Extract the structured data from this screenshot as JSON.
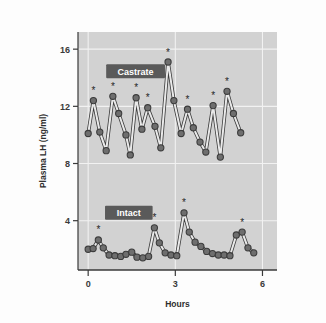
{
  "figure": {
    "background_color": "#fdfdfd",
    "plot_background_color": "#d2d2d2",
    "grid_color": "#f2f2f2",
    "axis_color": "#3a3a3a",
    "marker_color": "#6e6e6e",
    "marker_edge_color": "#3c3c3c",
    "line_color": "#e9e9e9",
    "label_box_color": "#5a5a5a"
  },
  "chart_data": {
    "type": "line",
    "title": "",
    "xlabel": "Hours",
    "ylabel": "Plasma LH (ng/ml)",
    "xlim": [
      -0.35,
      6.5
    ],
    "ylim": [
      0.55,
      17.2
    ],
    "xticks": [
      0,
      3,
      6
    ],
    "xtick_labels": [
      "0",
      "3",
      "6"
    ],
    "yticks": [
      4,
      8,
      12,
      16
    ],
    "ytick_labels": [
      "4",
      "8",
      "12",
      "16"
    ],
    "grid": true,
    "legend_position": "inline-annotation",
    "series": [
      {
        "name": "Castrate",
        "label_x": 0.62,
        "label_y": 14.45,
        "x": [
          0.0,
          0.2,
          0.4,
          0.6,
          0.8,
          1.0,
          1.2,
          1.4,
          1.6,
          1.8,
          2.0,
          2.2,
          2.4,
          2.6,
          2.8,
          3.0,
          3.2,
          3.4,
          3.6,
          3.8,
          4.0,
          4.2,
          4.4,
          4.6,
          4.8,
          5.0,
          5.2,
          5.4,
          5.6,
          5.8,
          6.0,
          6.2
        ],
        "values": [
          10.1,
          12.4,
          10.2,
          8.9,
          12.7,
          11.5,
          10.0,
          8.6,
          12.6,
          10.4,
          11.9,
          10.6,
          9.1,
          15.1,
          12.4,
          10.1,
          11.8,
          10.5,
          9.5,
          8.8,
          12.05,
          8.45,
          13.05,
          11.5,
          10.15,
          10.15,
          10.15,
          10.15,
          10.15,
          10.15,
          10.15,
          10.15
        ],
        "points": [
          {
            "x": 0.0,
            "y": 10.1,
            "star": false
          },
          {
            "x": 0.18,
            "y": 12.4,
            "star": true
          },
          {
            "x": 0.4,
            "y": 10.2,
            "star": false
          },
          {
            "x": 0.62,
            "y": 8.9,
            "star": false
          },
          {
            "x": 0.85,
            "y": 12.7,
            "star": true
          },
          {
            "x": 1.05,
            "y": 11.5,
            "star": false
          },
          {
            "x": 1.3,
            "y": 10.0,
            "star": false
          },
          {
            "x": 1.45,
            "y": 8.6,
            "star": false
          },
          {
            "x": 1.65,
            "y": 12.6,
            "star": true
          },
          {
            "x": 1.85,
            "y": 10.4,
            "star": false
          },
          {
            "x": 2.05,
            "y": 11.9,
            "star": true
          },
          {
            "x": 2.3,
            "y": 10.6,
            "star": false
          },
          {
            "x": 2.5,
            "y": 9.1,
            "star": false
          },
          {
            "x": 2.75,
            "y": 15.1,
            "star": true
          },
          {
            "x": 2.95,
            "y": 12.4,
            "star": false
          },
          {
            "x": 3.2,
            "y": 10.1,
            "star": false
          },
          {
            "x": 3.42,
            "y": 11.8,
            "star": true
          },
          {
            "x": 3.62,
            "y": 10.5,
            "star": false
          },
          {
            "x": 3.85,
            "y": 9.5,
            "star": false
          },
          {
            "x": 4.05,
            "y": 8.8,
            "star": false
          },
          {
            "x": 4.3,
            "y": 12.05,
            "star": true
          },
          {
            "x": 4.55,
            "y": 8.45,
            "star": false
          },
          {
            "x": 4.78,
            "y": 13.05,
            "star": true
          },
          {
            "x": 5.0,
            "y": 11.5,
            "star": false
          },
          {
            "x": 5.25,
            "y": 10.15,
            "star": false
          }
        ]
      },
      {
        "name": "Intact",
        "label_x": 0.58,
        "label_y": 4.55,
        "points": [
          {
            "x": 0.0,
            "y": 2.0,
            "star": false
          },
          {
            "x": 0.17,
            "y": 2.05,
            "star": false
          },
          {
            "x": 0.35,
            "y": 2.65,
            "star": true
          },
          {
            "x": 0.52,
            "y": 2.1,
            "star": false
          },
          {
            "x": 0.72,
            "y": 1.6,
            "star": false
          },
          {
            "x": 0.92,
            "y": 1.55,
            "star": false
          },
          {
            "x": 1.12,
            "y": 1.5,
            "star": false
          },
          {
            "x": 1.3,
            "y": 1.65,
            "star": false
          },
          {
            "x": 1.5,
            "y": 1.8,
            "star": false
          },
          {
            "x": 1.68,
            "y": 1.45,
            "star": false
          },
          {
            "x": 1.88,
            "y": 1.4,
            "star": false
          },
          {
            "x": 2.08,
            "y": 1.5,
            "star": false
          },
          {
            "x": 2.28,
            "y": 3.5,
            "star": true
          },
          {
            "x": 2.45,
            "y": 2.45,
            "star": false
          },
          {
            "x": 2.65,
            "y": 1.75,
            "star": false
          },
          {
            "x": 2.85,
            "y": 1.6,
            "star": false
          },
          {
            "x": 3.05,
            "y": 1.55,
            "star": false
          },
          {
            "x": 3.3,
            "y": 4.55,
            "star": true
          },
          {
            "x": 3.48,
            "y": 3.2,
            "star": false
          },
          {
            "x": 3.68,
            "y": 2.5,
            "star": false
          },
          {
            "x": 3.88,
            "y": 2.2,
            "star": false
          },
          {
            "x": 4.08,
            "y": 1.85,
            "star": false
          },
          {
            "x": 4.28,
            "y": 1.7,
            "star": false
          },
          {
            "x": 4.48,
            "y": 1.6,
            "star": false
          },
          {
            "x": 4.68,
            "y": 1.6,
            "star": false
          },
          {
            "x": 4.88,
            "y": 1.55,
            "star": false
          },
          {
            "x": 5.1,
            "y": 3.0,
            "star": false
          },
          {
            "x": 5.3,
            "y": 3.2,
            "star": true
          },
          {
            "x": 5.5,
            "y": 2.1,
            "star": false
          },
          {
            "x": 5.7,
            "y": 1.75,
            "star": false
          }
        ]
      }
    ],
    "annotations": {
      "star_meaning": "*"
    }
  }
}
